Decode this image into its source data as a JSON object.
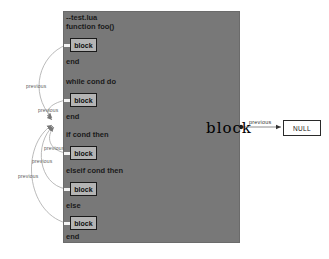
{
  "diagram": {
    "type": "graph",
    "title": "block",
    "background": "#ffffff",
    "node_fill": "#787878",
    "child_fill": "#b4b4b4",
    "edge_color": "#9a9a9a"
  },
  "main_node": {
    "label": "block",
    "code_lines": [
      {
        "text": "--test.lua",
        "y": 13
      },
      {
        "text": "function foo()",
        "y": 22
      },
      {
        "text": "end",
        "y": 57
      },
      {
        "text": "while cond do",
        "y": 77
      },
      {
        "text": "end",
        "y": 112
      },
      {
        "text": "if cond then",
        "y": 130
      },
      {
        "text": "elseif cond then",
        "y": 166
      },
      {
        "text": "else",
        "y": 201
      },
      {
        "text": "end",
        "y": 232
      }
    ]
  },
  "child_blocks": [
    {
      "label": "block",
      "y": 38
    },
    {
      "label": "block",
      "y": 93
    },
    {
      "label": "block",
      "y": 146
    },
    {
      "label": "block",
      "y": 182
    },
    {
      "label": "block",
      "y": 216
    }
  ],
  "edge_labels": [
    {
      "text": "previous",
      "x": 26,
      "y": 83
    },
    {
      "text": "previous",
      "x": 38,
      "y": 107
    },
    {
      "text": "previous",
      "x": 44,
      "y": 145
    },
    {
      "text": "previous",
      "x": 32,
      "y": 158
    },
    {
      "text": "previous",
      "x": 18,
      "y": 173
    }
  ],
  "null_edge": {
    "label": "previous",
    "target_label": "NULL"
  }
}
